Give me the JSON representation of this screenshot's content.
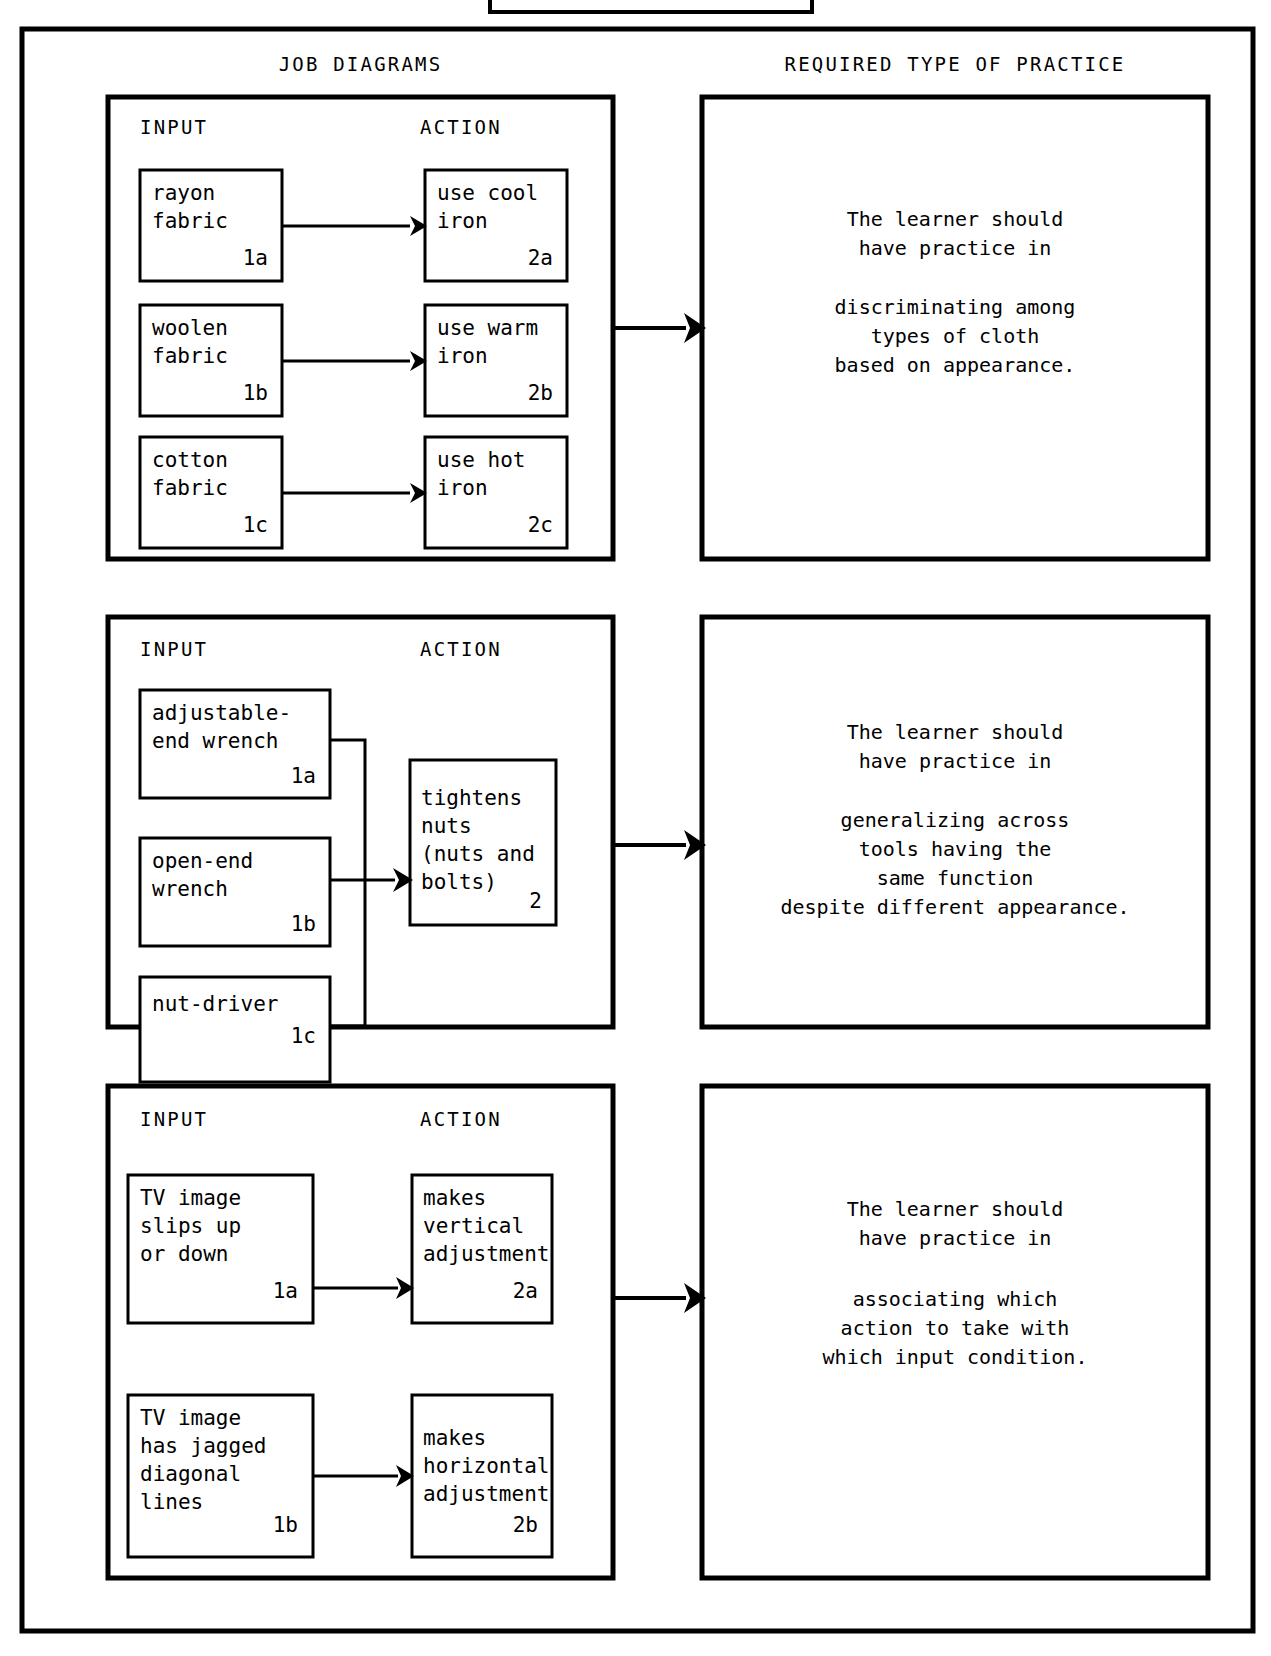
{
  "column_headers": {
    "left": "JOB DIAGRAMS",
    "right": "REQUIRED TYPE OF PRACTICE"
  },
  "section_labels": {
    "input": "INPUT",
    "action": "ACTION"
  },
  "sections": [
    {
      "id": "ironing",
      "pairs": [
        {
          "input": {
            "lines": "rayon\nfabric",
            "num": "1a"
          },
          "action": {
            "lines": "use cool\niron",
            "num": "2a"
          }
        },
        {
          "input": {
            "lines": "woolen\nfabric",
            "num": "1b"
          },
          "action": {
            "lines": "use warm\niron",
            "num": "2b"
          }
        },
        {
          "input": {
            "lines": "cotton\nfabric",
            "num": "1c"
          },
          "action": {
            "lines": "use hot\niron",
            "num": "2c"
          }
        }
      ],
      "practice": {
        "lead": "The learner should\nhave practice in",
        "body": "discriminating among\ntypes of cloth\nbased on appearance."
      }
    },
    {
      "id": "wrenches",
      "inputs": [
        {
          "lines": "adjustable-\nend wrench",
          "num": "1a"
        },
        {
          "lines": "open-end\nwrench",
          "num": "1b"
        },
        {
          "lines": "nut-driver",
          "num": "1c"
        }
      ],
      "action": {
        "lines": "tightens\nnuts\n(nuts and\nbolts)",
        "num": "2"
      },
      "practice": {
        "lead": "The learner should\nhave practice in",
        "body": "generalizing across\ntools having the\nsame function\ndespite different appearance."
      }
    },
    {
      "id": "tv-tuning",
      "pairs": [
        {
          "input": {
            "lines": "TV image\nslips up\nor down",
            "num": "1a"
          },
          "action": {
            "lines": "makes\nvertical\nadjustment",
            "num": "2a"
          }
        },
        {
          "input": {
            "lines": "TV image\nhas jagged\ndiagonal\nlines",
            "num": "1b"
          },
          "action": {
            "lines": "makes\nhorizontal\nadjustment",
            "num": "2b"
          }
        }
      ],
      "practice": {
        "lead": "The learner should\nhave practice in",
        "body": "associating which\naction to take with\nwhich input condition."
      }
    }
  ],
  "colors": {
    "ink": "#000000",
    "paper": "#ffffff"
  }
}
